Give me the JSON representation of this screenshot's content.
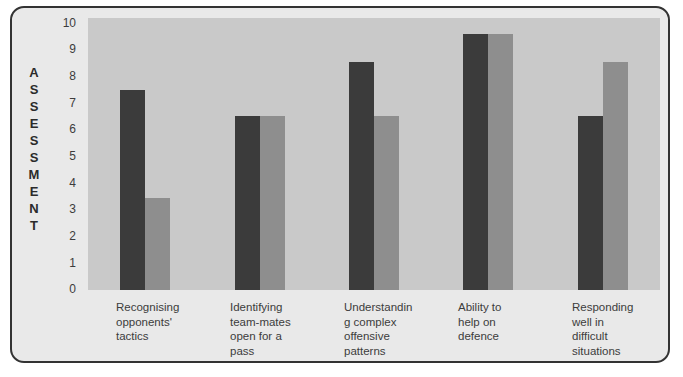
{
  "chart_data": {
    "type": "bar",
    "title": "",
    "xlabel": "",
    "ylabel": "ASSESSMENT",
    "ylim": [
      0,
      10
    ],
    "yticks": [
      10,
      9,
      8,
      7,
      6,
      5,
      4,
      3,
      2,
      1,
      0
    ],
    "grid": false,
    "legend": "none",
    "categories": [
      "Recognising opponents' tactics",
      "Identifying team-mates open for a pass",
      "Understanding complex offensive patterns",
      "Ability to help on defence",
      "Responding well in difficult situations"
    ],
    "series": [
      {
        "name": "Series 1",
        "color": "#3b3b3b",
        "values": [
          7.35,
          6.4,
          8.4,
          9.4,
          6.4
        ]
      },
      {
        "name": "Series 2",
        "color": "#8e8e8e",
        "values": [
          3.4,
          6.4,
          6.4,
          9.4,
          8.4
        ]
      }
    ],
    "colors": {
      "series1": "#3b3b3b",
      "series2": "#8e8e8e",
      "plot_background": "#c9c9c9",
      "figure_background": "#e9e9e9",
      "frame_border": "#333333"
    }
  },
  "axis": {
    "vertical_title_letters": [
      "A",
      "S",
      "S",
      "E",
      "S",
      "S",
      "M",
      "E",
      "N",
      "T"
    ],
    "tick_labels": [
      "10",
      "9",
      "8",
      "7",
      "6",
      "5",
      "4",
      "3",
      "2",
      "1",
      "0"
    ]
  },
  "category_label_lines": [
    [
      "Recognising",
      "opponents'",
      "tactics"
    ],
    [
      "Identifying",
      "team-mates",
      "open for a",
      "pass"
    ],
    [
      "Understandin",
      "g complex",
      "offensive",
      "patterns"
    ],
    [
      "Ability to",
      "help on",
      "defence"
    ],
    [
      "Responding",
      "well in",
      "difficult",
      "situations"
    ]
  ]
}
